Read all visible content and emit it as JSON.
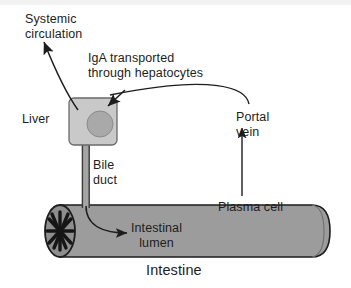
{
  "figure": {
    "background_color": "#ffffff"
  },
  "colors": {
    "stroke": "#1d1d1d",
    "liver_box_fill": "#c9c9c9",
    "liver_nucleus_fill": "#a9a9a9",
    "intestine_fill": "#9c9c9c",
    "intestine_cap_fill": "#8e8e8e",
    "bile_duct_fill": "#a5a5a5",
    "top_band": "#f2f2f2",
    "text": "#1d1d1d"
  },
  "labels": {
    "systemic_circulation": "Systemic\ncirculation",
    "iga_transport": "IgA transported\nthrough hepatocytes",
    "liver": "Liver",
    "portal_vein": "Portal\nvein",
    "bile_duct": "Bile\nduct",
    "intestinal_lumen": "Intestinal\nlumen",
    "plasma_cell": "Plasma cell",
    "intestine": "Intestine"
  },
  "shapes": {
    "liver": {
      "name": "liver-cell",
      "x": 69,
      "y": 98,
      "width": 48,
      "height": 47,
      "radius": 5
    },
    "liver_nucleus": {
      "name": "hepatocyte-nucleus",
      "cx": 100,
      "cy": 124,
      "r": 13
    },
    "bile_duct": {
      "name": "bile-duct-tube",
      "x": 82,
      "y": 141,
      "width": 7,
      "height": 66
    },
    "intestine_tube": {
      "name": "intestine-tube",
      "x": 52,
      "y": 205,
      "width": 278,
      "height": 52
    },
    "intestine_left_cap": {
      "name": "intestine-left-opening",
      "cx": 60,
      "cy": 231,
      "rx": 15,
      "ry": 26
    },
    "villi_star": {
      "name": "intestinal-villi-star",
      "cx": 60,
      "cy": 231
    }
  },
  "arrows": [
    {
      "name": "systemic-circulation-arrow",
      "from": "liver",
      "to": "systemic circulation",
      "direction": "up-left"
    },
    {
      "name": "iga-transport-arrow",
      "from": "portal vein",
      "to": "liver",
      "direction": "down-left"
    },
    {
      "name": "portal-vein-curve",
      "from": "portal vein",
      "to": "liver",
      "direction": "left"
    },
    {
      "name": "plasma-cell-arrow",
      "from": "intestine",
      "to": "portal vein",
      "direction": "up"
    },
    {
      "name": "bile-duct-arrow",
      "from": "liver",
      "to": "intestinal lumen",
      "direction": "down-right"
    }
  ]
}
